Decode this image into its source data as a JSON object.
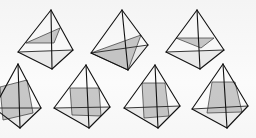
{
  "figure": {
    "colors": {
      "edge": "#111111",
      "section": "#bdbdbd",
      "face": "#e9e9e9",
      "background": "#f6f6f6"
    },
    "rows": [
      {
        "name": "top-row",
        "items": [
          {
            "id": "t1",
            "section_type": "triangle",
            "apex": [
              51,
              10
            ],
            "left": [
              18,
              52
            ],
            "right": [
              73,
              50
            ],
            "bottom": [
              52,
              69
            ],
            "section": [
              [
                26,
                43
              ],
              [
                60,
                28
              ],
              [
                54,
                43
              ]
            ]
          },
          {
            "id": "t2",
            "section_type": "triangle",
            "apex": [
              122,
              10
            ],
            "left": [
              91,
              53
            ],
            "right": [
              148,
              45
            ],
            "bottom": [
              128,
              70
            ],
            "section": [
              [
                91,
                53
              ],
              [
                141,
                35
              ],
              [
                128,
                70
              ]
            ]
          },
          {
            "id": "t3",
            "section_type": "triangle",
            "apex": [
              197,
              10
            ],
            "left": [
              166,
              52
            ],
            "right": [
              224,
              50
            ],
            "bottom": [
              200,
              69
            ],
            "section": [
              [
                176,
                38
              ],
              [
                214,
                38
              ],
              [
                201,
                48
              ]
            ]
          }
        ]
      },
      {
        "name": "bottom-row",
        "items": [
          {
            "id": "b1",
            "section_type": "quadrilateral",
            "apex": [
              18,
              64
            ],
            "left": [
              -6,
              108
            ],
            "right": [
              41,
              108
            ],
            "bottom": [
              20,
              128
            ],
            "section": [
              [
                0,
                87
              ],
              [
                27,
                80
              ],
              [
                33,
                113
              ],
              [
                3,
                120
              ]
            ]
          },
          {
            "id": "b2",
            "section_type": "quadrilateral",
            "apex": [
              86,
              65
            ],
            "left": [
              54,
              108
            ],
            "right": [
              110,
              107
            ],
            "bottom": [
              89,
              128
            ],
            "section": [
              [
                70,
                88
              ],
              [
                99,
                88
              ],
              [
                101,
                116
              ],
              [
                72,
                115
              ]
            ]
          },
          {
            "id": "b3",
            "section_type": "quadrilateral",
            "apex": [
              155,
              65
            ],
            "left": [
              124,
              108
            ],
            "right": [
              180,
              106
            ],
            "bottom": [
              158,
              128
            ],
            "section": [
              [
                142,
                83
              ],
              [
                165,
                83
              ],
              [
                169,
                116
              ],
              [
                144,
                118
              ]
            ]
          },
          {
            "id": "b4",
            "section_type": "quadrilateral",
            "apex": [
              223,
              64
            ],
            "left": [
              192,
              109
            ],
            "right": [
              248,
              106
            ],
            "bottom": [
              227,
              128
            ],
            "section": [
              [
                212,
                82
              ],
              [
                235,
                82
              ],
              [
                242,
                112
              ],
              [
                207,
                113
              ]
            ]
          }
        ]
      }
    ]
  }
}
